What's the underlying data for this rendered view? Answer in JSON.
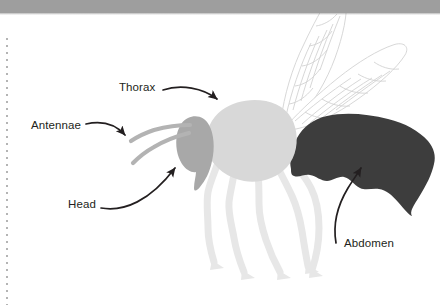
{
  "figure": {
    "background_color": "#ffffff",
    "top_bar": {
      "name": "page-header-bar",
      "color": "#9e9e9e",
      "height_px": 13
    },
    "margin_rule": {
      "name": "dotted-margin-rule",
      "color": "#b4b4b4",
      "style": "dotted",
      "orientation": "vertical"
    },
    "parts": [
      {
        "id": "head",
        "label": "Head",
        "color": "#a8a8a8"
      },
      {
        "id": "antennae",
        "label": "Antennae",
        "color": "#a8a8a8"
      },
      {
        "id": "thorax",
        "label": "Thorax",
        "color": "#d8d8d8"
      },
      {
        "id": "abdomen",
        "label": "Abdomen",
        "color": "#3d3d3d"
      },
      {
        "id": "legs",
        "label": "Legs",
        "color": "#e6e6e6"
      },
      {
        "id": "wings",
        "label": "Wings",
        "color": "#d5d5d5"
      }
    ],
    "labels": {
      "thorax": "Thorax",
      "antennae": "Antennae",
      "head": "Head",
      "abdomen": "Abdomen"
    },
    "annotation": {
      "arrow_color": "#231f20",
      "text_color": "#231f20"
    }
  }
}
